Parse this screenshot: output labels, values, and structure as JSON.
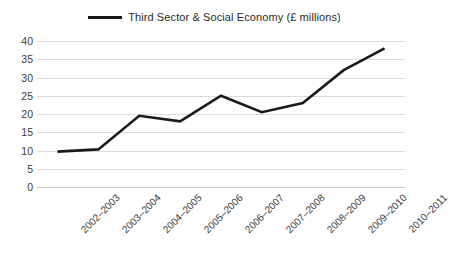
{
  "legend": {
    "entries": [
      {
        "label": "Third Sector & Social Economy (£ millions)",
        "color": "#1a1a1a"
      }
    ]
  },
  "chart_data": {
    "type": "line",
    "title": "",
    "subtitle": "",
    "xlabel": "",
    "ylabel": "",
    "categories": [
      "2002–2003",
      "2003–2004",
      "2004–2005",
      "2005–2006",
      "2006–2007",
      "2007–2008",
      "2008–2009",
      "2009–2010",
      "2010–2011"
    ],
    "series": [
      {
        "name": "Third Sector & Social Economy (£ millions)",
        "color": "#1a1a1a",
        "values": [
          9.7,
          10.3,
          19.5,
          18,
          25,
          20.5,
          23,
          32,
          38
        ]
      }
    ],
    "ylim": [
      0,
      40
    ],
    "yticks": [
      0,
      5,
      10,
      15,
      20,
      25,
      30,
      35,
      40
    ],
    "ytick_labels": [
      "0",
      "5",
      "10",
      "15",
      "20",
      "25",
      "30",
      "35",
      "40"
    ],
    "grid": "horizontal",
    "grid_color": "#dcdcdc",
    "legend_position": "top-center",
    "background": "#ffffff",
    "xtick_rotation": -45
  }
}
